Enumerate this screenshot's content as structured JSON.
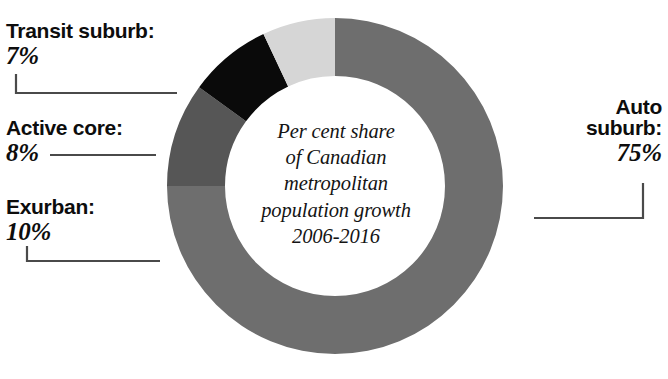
{
  "chart_data": {
    "type": "pie",
    "variant": "donut",
    "title": "",
    "subtitle": "",
    "center_caption_lines": [
      "Per cent share",
      "of Canadian",
      "metropolitan",
      "population growth",
      "2006-2016"
    ],
    "categories": [
      "Auto suburb",
      "Transit suburb",
      "Active core",
      "Exurban"
    ],
    "values": [
      75,
      7,
      8,
      10
    ],
    "value_labels": [
      "75%",
      "7%",
      "8%",
      "10%"
    ],
    "unit": "%",
    "total": 100,
    "start_angle_deg": -90,
    "direction": "clockwise",
    "legend": "none",
    "grid": false,
    "colors": {
      "auto_suburb": "#6e6e6e",
      "transit_suburb": "#d6d6d6",
      "active_core": "#0a0a0a",
      "exurban": "#565656",
      "background": "#ffffff",
      "text": "#0d0d0d",
      "leader_line": "#4a4a4a"
    },
    "slices": [
      {
        "key": "auto_suburb",
        "label": "Auto suburb:",
        "value": 75,
        "value_label": "75%",
        "color": "#6e6e6e",
        "start_deg": -90,
        "end_deg": 180
      },
      {
        "key": "exurban",
        "label": "Exurban:",
        "value": 10,
        "value_label": "10%",
        "color": "#565656",
        "start_deg": 180,
        "end_deg": 216
      },
      {
        "key": "active_core",
        "label": "Active core:",
        "value": 8,
        "value_label": "8%",
        "color": "#0a0a0a",
        "start_deg": 216,
        "end_deg": 244.8
      },
      {
        "key": "transit_suburb",
        "label": "Transit suburb:",
        "value": 7,
        "value_label": "7%",
        "color": "#d6d6d6",
        "start_deg": 244.8,
        "end_deg": 270
      }
    ]
  },
  "callouts": {
    "transit_suburb": {
      "category": "Transit suburb:",
      "percent": "7%"
    },
    "active_core": {
      "category": "Active core:",
      "percent": "8%"
    },
    "exurban": {
      "category": "Exurban:",
      "percent": "10%"
    },
    "auto_suburb": {
      "category_line1": "Auto",
      "category_line2": "suburb:",
      "percent": "75%"
    }
  },
  "center": {
    "line1": "Per cent share",
    "line2": "of Canadian",
    "line3": "metropolitan",
    "line4": "population growth",
    "line5": "2006-2016"
  }
}
